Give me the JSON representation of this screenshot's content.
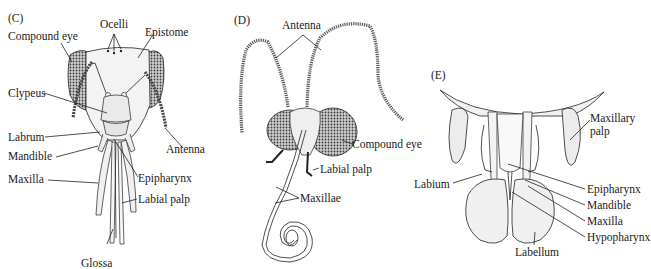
{
  "figure": {
    "panels": [
      {
        "id": "C",
        "letter": "(C)",
        "labels": {
          "ocelli": "Ocelli",
          "compound_eye": "Compound eye",
          "epistome": "Epistome",
          "clypeus": "Clypeus",
          "labrum": "Labrum",
          "mandible": "Mandible",
          "antenna": "Antenna",
          "epipharynx": "Epipharynx",
          "maxilla": "Maxilla",
          "labial_palp": "Labial palp",
          "glossa": "Glossa"
        }
      },
      {
        "id": "D",
        "letter": "(D)",
        "labels": {
          "antenna": "Antenna",
          "compound_eye": "Compound eye",
          "labial_palp": "Labial palp",
          "maxillae": "Maxillae"
        }
      },
      {
        "id": "E",
        "letter": "(E)",
        "labels": {
          "maxillary_palp_line1": "Maxillary",
          "maxillary_palp_line2": "palp",
          "labium": "Labium",
          "epipharynx": "Epipharynx",
          "mandible": "Mandible",
          "maxilla": "Maxilla",
          "hypopharynx": "Hypopharynx",
          "labellum": "Labellum"
        }
      }
    ]
  }
}
